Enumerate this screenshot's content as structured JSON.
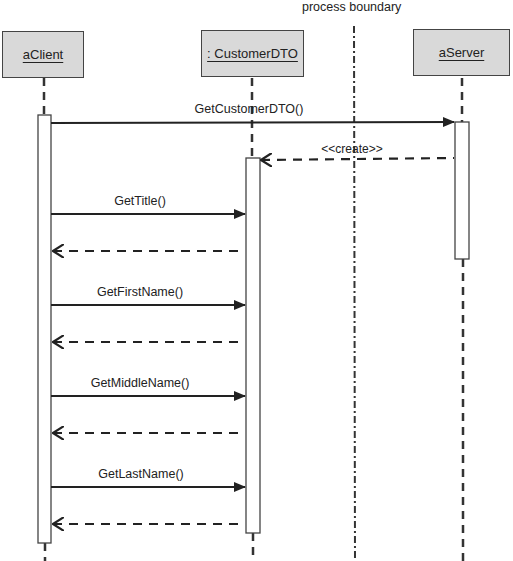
{
  "diagram": {
    "type": "sequence",
    "boundary_label": "process boundary",
    "participants": [
      {
        "id": "client",
        "label": "aClient"
      },
      {
        "id": "dto",
        "label": ": CustomerDTO"
      },
      {
        "id": "server",
        "label": "aServer"
      }
    ],
    "messages": [
      {
        "from": "client",
        "to": "server",
        "label": "GetCustomerDTO()",
        "kind": "call"
      },
      {
        "from": "server",
        "to": "dto",
        "label": "<<create>>",
        "kind": "create"
      },
      {
        "from": "client",
        "to": "dto",
        "label": "GetTitle()",
        "kind": "call"
      },
      {
        "from": "dto",
        "to": "client",
        "label": "",
        "kind": "return"
      },
      {
        "from": "client",
        "to": "dto",
        "label": "GetFirstName()",
        "kind": "call"
      },
      {
        "from": "dto",
        "to": "client",
        "label": "",
        "kind": "return"
      },
      {
        "from": "client",
        "to": "dto",
        "label": "GetMiddleName()",
        "kind": "call"
      },
      {
        "from": "dto",
        "to": "client",
        "label": "",
        "kind": "return"
      },
      {
        "from": "client",
        "to": "dto",
        "label": "GetLastName()",
        "kind": "call"
      },
      {
        "from": "dto",
        "to": "client",
        "label": "",
        "kind": "return"
      }
    ]
  }
}
